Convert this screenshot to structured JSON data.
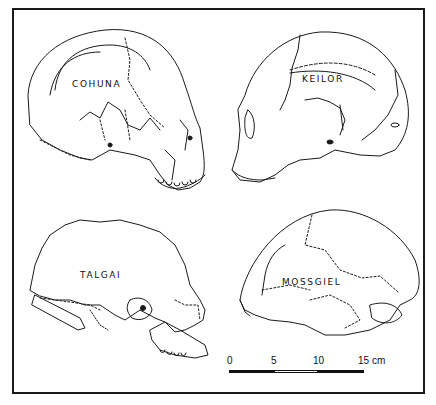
{
  "figure": {
    "specimens": [
      {
        "id": "cohuna",
        "label": "COHUNA"
      },
      {
        "id": "keilor",
        "label": "KEILOR"
      },
      {
        "id": "talgai",
        "label": "TALGAI"
      },
      {
        "id": "mossgiel",
        "label": "MOSSGIEL"
      }
    ],
    "scale_bar": {
      "ticks": [
        "0",
        "5",
        "10",
        "15 cm"
      ],
      "segments": [
        "dark",
        "light",
        "dark"
      ],
      "unit": "cm",
      "max": 15
    }
  }
}
